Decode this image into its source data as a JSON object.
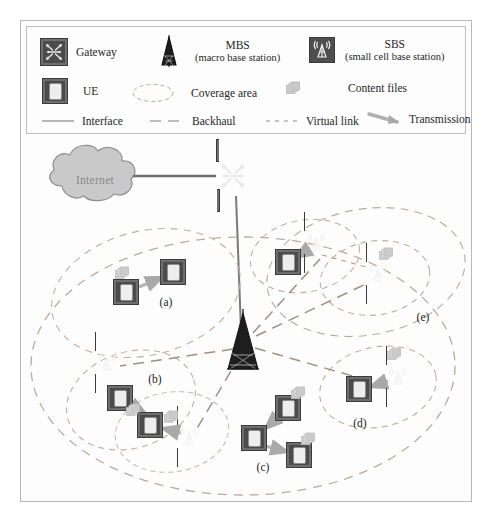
{
  "figure": {
    "background": "#fdfdfd",
    "frame_color": "#b8b8b8"
  },
  "legend": {
    "box_border": "#bdbdbd",
    "entries": [
      {
        "id": "gateway",
        "icon": "gateway-icon",
        "label": "Gateway",
        "sublabel": ""
      },
      {
        "id": "mbs",
        "icon": "mbs-tower-icon",
        "label": "MBS",
        "sublabel": "(macro base station)"
      },
      {
        "id": "sbs",
        "icon": "sbs-icon",
        "label": "SBS",
        "sublabel": "(small cell base station)"
      },
      {
        "id": "ue",
        "icon": "ue-icon",
        "label": "UE",
        "sublabel": ""
      },
      {
        "id": "coverage",
        "icon": "coverage-ellipse-icon",
        "label": "Coverage area",
        "sublabel": ""
      },
      {
        "id": "files",
        "icon": "content-files-icon",
        "label": "Content files",
        "sublabel": ""
      }
    ],
    "lines": [
      {
        "id": "interface",
        "label": "Interface",
        "style": "solid",
        "color": "#7d7d7d"
      },
      {
        "id": "backhaul",
        "label": "Backhaul",
        "style": "long-dash",
        "color": "#7d7d7d"
      },
      {
        "id": "virtual",
        "label": "Virtual link",
        "style": "short-dash",
        "color": "#7d7d7d"
      },
      {
        "id": "transmission",
        "label": "Transmission",
        "style": "arrow",
        "color": "#9a9a9a"
      }
    ]
  },
  "topology": {
    "internet": {
      "label": "Internet",
      "x": 95,
      "y": 180
    },
    "gateway": {
      "x": 233,
      "y": 176
    },
    "mbs": {
      "x": 243,
      "y": 341
    },
    "clusters": [
      {
        "id": "a",
        "label": "(a)",
        "lx": 166,
        "ly": 302
      },
      {
        "id": "b",
        "label": "(b)",
        "lx": 155,
        "ly": 379
      },
      {
        "id": "c",
        "label": "(c)",
        "lx": 263,
        "ly": 467
      },
      {
        "id": "d",
        "label": "(d)",
        "lx": 360,
        "ly": 423
      },
      {
        "id": "e",
        "label": "(e)",
        "lx": 423,
        "ly": 317
      }
    ],
    "nodes": [
      {
        "type": "ue",
        "name": "ue-a1",
        "x": 126,
        "y": 292
      },
      {
        "type": "ue",
        "name": "ue-a2",
        "x": 173,
        "y": 272
      },
      {
        "type": "sbs",
        "name": "sbs-b1",
        "x": 107,
        "y": 363
      },
      {
        "type": "ue",
        "name": "ue-b1",
        "x": 120,
        "y": 398
      },
      {
        "type": "ue",
        "name": "ue-b2",
        "x": 150,
        "y": 425
      },
      {
        "type": "sbs",
        "name": "sbs-b2",
        "x": 189,
        "y": 437
      },
      {
        "type": "ue",
        "name": "ue-c1",
        "x": 288,
        "y": 408
      },
      {
        "type": "ue",
        "name": "ue-c2",
        "x": 254,
        "y": 438
      },
      {
        "type": "ue",
        "name": "ue-c3",
        "x": 299,
        "y": 455
      },
      {
        "type": "ue",
        "name": "ue-d1",
        "x": 359,
        "y": 389
      },
      {
        "type": "sbs",
        "name": "sbs-d1",
        "x": 398,
        "y": 377
      },
      {
        "type": "ue",
        "name": "ue-e1",
        "x": 288,
        "y": 262
      },
      {
        "type": "sbs",
        "name": "sbs-e1",
        "x": 316,
        "y": 243
      },
      {
        "type": "sbs",
        "name": "sbs-e2",
        "x": 378,
        "y": 274
      }
    ],
    "files": [
      {
        "name": "file-a",
        "x": 122,
        "y": 276
      },
      {
        "name": "file-b",
        "x": 133,
        "y": 413
      },
      {
        "name": "file-b2",
        "x": 171,
        "y": 420
      },
      {
        "name": "file-c1",
        "x": 298,
        "y": 396
      },
      {
        "name": "file-c2",
        "x": 308,
        "y": 442
      },
      {
        "name": "file-d",
        "x": 394,
        "y": 357
      },
      {
        "name": "file-e",
        "x": 386,
        "y": 257
      }
    ]
  }
}
